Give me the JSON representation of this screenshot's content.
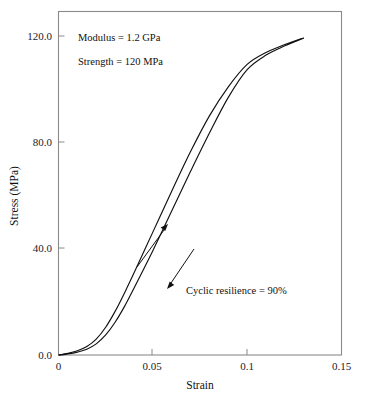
{
  "chart_data": {
    "type": "line",
    "title": "",
    "xlabel": "Strain",
    "ylabel": "Stress (MPa)",
    "xlim": [
      0,
      0.15
    ],
    "ylim": [
      0,
      130
    ],
    "grid": false,
    "legend_position": "none",
    "x_ticks": [
      "0",
      "0.05",
      "0.1",
      "0.15"
    ],
    "x_tick_values": [
      0,
      0.05,
      0.1,
      0.15
    ],
    "y_ticks": [
      "0.0",
      "40.0",
      "80.0",
      "120.0"
    ],
    "y_tick_values": [
      0,
      40,
      80,
      120
    ],
    "series": [
      {
        "name": "Loading curve",
        "x": [
          0,
          0.005,
          0.01,
          0.015,
          0.02,
          0.025,
          0.03,
          0.035,
          0.04,
          0.05,
          0.06,
          0.07,
          0.08,
          0.09,
          0.1,
          0.11,
          0.12,
          0.13
        ],
        "values": [
          0,
          0.6,
          1.6,
          3.2,
          6.0,
          10.5,
          16.5,
          23.5,
          31.0,
          46.5,
          62.0,
          77.0,
          90.5,
          101.5,
          110.0,
          114.5,
          117.5,
          120.0
        ]
      },
      {
        "name": "Unloading curve",
        "x": [
          0,
          0.005,
          0.01,
          0.015,
          0.02,
          0.025,
          0.03,
          0.035,
          0.04,
          0.05,
          0.06,
          0.07,
          0.08,
          0.09,
          0.1,
          0.11,
          0.12,
          0.13
        ],
        "values": [
          0,
          0.4,
          1.1,
          2.2,
          4.2,
          7.6,
          12.4,
          18.4,
          25.3,
          39.5,
          54.5,
          69.5,
          84.0,
          97.5,
          108.0,
          113.5,
          117.0,
          120.0
        ]
      }
    ],
    "annotations": [
      {
        "id": "modulus",
        "text": "Modulus = 1.2 GPa"
      },
      {
        "id": "strength",
        "text": "Strength = 120 MPa"
      },
      {
        "id": "cyclic",
        "text": "Cyclic resilience = 90%"
      }
    ],
    "arrows": [
      {
        "id": "loading-arrow",
        "direction": "up"
      },
      {
        "id": "unloading-arrow",
        "direction": "down"
      }
    ]
  },
  "colors": {
    "curve": "#111111",
    "frame": "#8a8a8a",
    "text": "#111111",
    "tick_text": "#1a1a2e",
    "background": "#ffffff"
  }
}
